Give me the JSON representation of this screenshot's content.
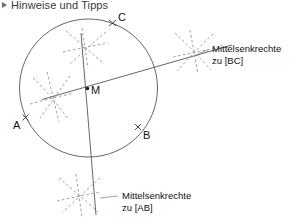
{
  "header": {
    "bullet_icon": "triangle-right-icon",
    "title": "Hinweise und Tipps"
  },
  "figure": {
    "caption_bc_line1": "Mittelsenkrechte",
    "caption_bc_line2": "zu [BC]",
    "caption_ab_line1": "Mittelsenkrechte",
    "caption_ab_line2": "zu [AB]",
    "points": {
      "A": "A",
      "B": "B",
      "C": "C",
      "M": "M"
    },
    "colors": {
      "stroke": "#4d4d4d",
      "dashed": "#8a8a8a",
      "text": "#111111",
      "background": "#ffffff"
    }
  }
}
